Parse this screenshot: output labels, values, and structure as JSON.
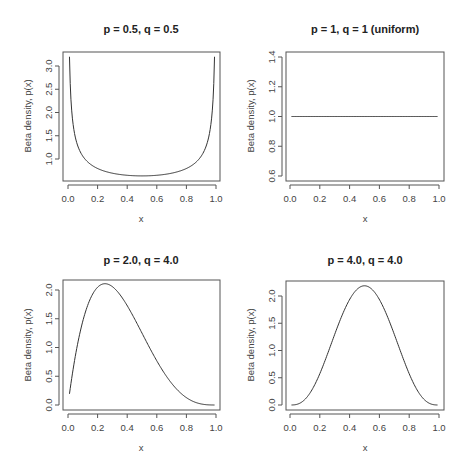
{
  "figure": {
    "width": 472,
    "height": 475,
    "background": "#ffffff",
    "line_color": "#333333"
  },
  "chart_data": [
    {
      "type": "line",
      "title": "p = 0.5, q = 0.5",
      "xlabel": "x",
      "ylabel": "Beta density, p(x)",
      "dist": {
        "p": 0.5,
        "q": 0.5
      },
      "xlim": [
        0.0,
        1.0
      ],
      "ylim": [
        0.6,
        3.3
      ],
      "xticks": [
        "0.0",
        "0.2",
        "0.4",
        "0.6",
        "0.8",
        "1.0"
      ],
      "yticks": [
        "1.0",
        "1.5",
        "2.0",
        "2.5",
        "3.0"
      ],
      "x": [
        0.01,
        0.05,
        0.1,
        0.2,
        0.3,
        0.4,
        0.5,
        0.6,
        0.7,
        0.8,
        0.9,
        0.95,
        0.99
      ],
      "y": [
        3.2,
        1.46,
        1.06,
        0.8,
        0.69,
        0.65,
        0.64,
        0.65,
        0.69,
        0.8,
        1.06,
        1.46,
        3.2
      ],
      "grid": false,
      "frame": {
        "x": 63,
        "y": 52,
        "w": 157,
        "h": 129
      },
      "px_map": {
        "x0": 68,
        "x1": 216,
        "yv0": 1.0,
        "ypx0": 159,
        "yv1": 3.0,
        "ypx1": 66
      }
    },
    {
      "type": "line",
      "title": "p = 1, q = 1 (uniform)",
      "xlabel": "x",
      "ylabel": "Beta density, p(x)",
      "dist": {
        "p": 1,
        "q": 1
      },
      "xlim": [
        0.0,
        1.0
      ],
      "ylim": [
        0.6,
        1.4
      ],
      "xticks": [
        "0.0",
        "0.2",
        "0.4",
        "0.6",
        "0.8",
        "1.0"
      ],
      "yticks": [
        "0.6",
        "0.8",
        "1.0",
        "1.2",
        "1.4"
      ],
      "x": [
        0.01,
        0.99
      ],
      "y": [
        1.0,
        1.0
      ],
      "grid": false,
      "frame": {
        "x": 286,
        "y": 52,
        "w": 158,
        "h": 129
      },
      "px_map": {
        "x0": 290,
        "x1": 439,
        "yv0": 0.6,
        "ypx0": 176,
        "yv1": 1.4,
        "ypx1": 57
      }
    },
    {
      "type": "line",
      "title": "p = 2.0, q = 4.0",
      "xlabel": "x",
      "ylabel": "Beta density, p(x)",
      "dist": {
        "p": 2.0,
        "q": 4.0
      },
      "xlim": [
        0.0,
        1.0
      ],
      "ylim": [
        0.0,
        2.1
      ],
      "xticks": [
        "0.0",
        "0.2",
        "0.4",
        "0.6",
        "0.8",
        "1.0"
      ],
      "yticks": [
        "0.0",
        "0.5",
        "1.0",
        "1.5",
        "2.0"
      ],
      "x": [
        0.01,
        0.1,
        0.2,
        0.25,
        0.3,
        0.4,
        0.5,
        0.6,
        0.7,
        0.8,
        0.9,
        0.99
      ],
      "y": [
        0.19,
        1.46,
        2.05,
        2.11,
        2.06,
        1.73,
        1.25,
        0.77,
        0.38,
        0.13,
        0.02,
        0.0
      ],
      "grid": false,
      "frame": {
        "x": 63,
        "y": 280,
        "w": 157,
        "h": 130
      },
      "px_map": {
        "x0": 68,
        "x1": 216,
        "yv0": 0.0,
        "ypx0": 405,
        "yv1": 2.0,
        "ypx1": 290
      }
    },
    {
      "type": "line",
      "title": "p = 4.0, q = 4.0",
      "xlabel": "x",
      "ylabel": "Beta density, p(x)",
      "dist": {
        "p": 4.0,
        "q": 4.0
      },
      "xlim": [
        0.0,
        1.0
      ],
      "ylim": [
        0.0,
        2.2
      ],
      "xticks": [
        "0.0",
        "0.2",
        "0.4",
        "0.6",
        "0.8",
        "1.0"
      ],
      "yticks": [
        "0.0",
        "0.5",
        "1.0",
        "1.5",
        "2.0"
      ],
      "x": [
        0.01,
        0.1,
        0.2,
        0.3,
        0.4,
        0.5,
        0.6,
        0.7,
        0.8,
        0.9,
        0.99
      ],
      "y": [
        0.0,
        0.1,
        0.55,
        1.3,
        1.94,
        2.19,
        1.94,
        1.3,
        0.55,
        0.1,
        0.0
      ],
      "grid": false,
      "frame": {
        "x": 286,
        "y": 281,
        "w": 158,
        "h": 129
      },
      "px_map": {
        "x0": 290,
        "x1": 439,
        "yv0": 0.0,
        "ypx0": 405,
        "yv1": 2.0,
        "ypx1": 296
      }
    }
  ]
}
